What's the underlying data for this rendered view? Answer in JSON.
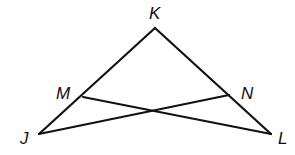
{
  "diagram": {
    "type": "geometry",
    "stroke_color": "#111111",
    "background": "#ffffff",
    "points": {
      "K": {
        "label": "K",
        "x": 155,
        "y": 28
      },
      "M": {
        "label": "M",
        "x": 83,
        "y": 97
      },
      "N": {
        "label": "N",
        "x": 229,
        "y": 95
      },
      "J": {
        "label": "J",
        "x": 39,
        "y": 134
      },
      "L": {
        "label": "L",
        "x": 271,
        "y": 134
      }
    },
    "segments": [
      [
        "K",
        "J"
      ],
      [
        "K",
        "L"
      ],
      [
        "J",
        "N"
      ],
      [
        "M",
        "L"
      ]
    ],
    "labels": {
      "K": "K",
      "M": "M",
      "N": "N",
      "J": "J",
      "L": "L"
    }
  }
}
